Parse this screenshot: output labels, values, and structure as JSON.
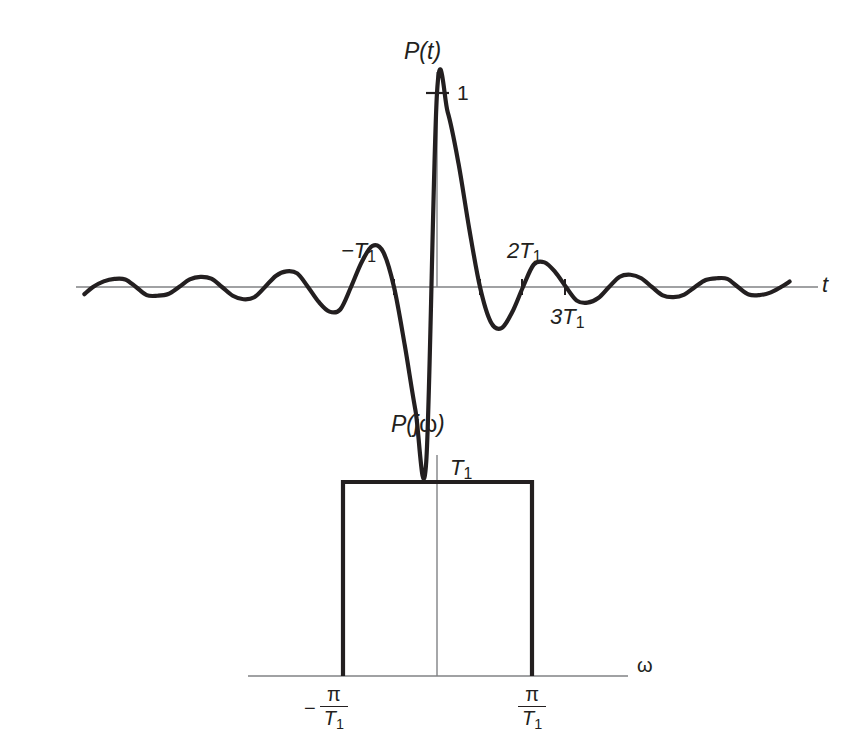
{
  "figure": {
    "background": "#ffffff",
    "ink": "#231f20",
    "axis_color": "#808285"
  },
  "chart_data": [
    {
      "type": "line",
      "title": "P(t)",
      "xlabel": "t",
      "ylabel": "",
      "description": "Sinc pulse p(t) = sin(pi t / T1) / (pi t / T1) in the time domain",
      "function": "sinc",
      "peak_value": 1,
      "peak_label": "1",
      "zero_crossings_T1": [
        -6,
        -5,
        -4,
        -3,
        -2,
        -1,
        1,
        2,
        3,
        4,
        5,
        6
      ],
      "x_range_T1": [
        -8.2,
        8.2
      ],
      "ylim": [
        -0.25,
        1.05
      ],
      "grid": false,
      "legend": false,
      "annotations": [
        {
          "text": "−T₁",
          "x_T1": -1,
          "position": "above-left"
        },
        {
          "text": "2T₁",
          "x_T1": 2,
          "position": "above"
        },
        {
          "text": "3T₁",
          "x_T1": 3,
          "position": "below"
        }
      ],
      "tick_positions_T1": [
        -1,
        1,
        2,
        3
      ],
      "x": [
        -8.2,
        -8.0,
        -7.75,
        -7.5,
        -7.25,
        -7.0,
        -6.75,
        -6.5,
        -6.25,
        -6.0,
        -5.75,
        -5.5,
        -5.25,
        -5.0,
        -4.75,
        -4.5,
        -4.25,
        -4.0,
        -3.75,
        -3.5,
        -3.25,
        -3.0,
        -2.75,
        -2.5,
        -2.25,
        -2.0,
        -1.75,
        -1.5,
        -1.25,
        -1.0,
        -0.75,
        -0.5,
        -0.25,
        0.0,
        0.25,
        0.5,
        0.75,
        1.0,
        1.25,
        1.5,
        1.75,
        2.0,
        2.25,
        2.5,
        2.75,
        3.0,
        3.25,
        3.5,
        3.75,
        4.0,
        4.25,
        4.5,
        4.75,
        5.0,
        5.25,
        5.5,
        5.75,
        6.0,
        6.25,
        6.5,
        6.75,
        7.0,
        7.25,
        7.5,
        7.75,
        8.0,
        8.2
      ],
      "y": [
        -0.037,
        -0.0,
        0.029,
        0.042,
        0.039,
        0.0,
        -0.042,
        -0.045,
        -0.036,
        0.0,
        0.039,
        0.052,
        0.043,
        0.0,
        -0.045,
        -0.063,
        -0.053,
        0.0,
        0.057,
        0.081,
        0.07,
        0.0,
        -0.077,
        -0.127,
        -0.116,
        0.0,
        0.129,
        0.212,
        0.18,
        0.0,
        -0.3,
        -0.637,
        -0.9,
        1.0,
        0.9,
        0.637,
        0.3,
        0.0,
        -0.18,
        -0.212,
        -0.129,
        0.0,
        0.116,
        0.127,
        0.077,
        0.0,
        -0.07,
        -0.081,
        -0.057,
        0.0,
        0.053,
        0.063,
        0.045,
        0.0,
        -0.043,
        -0.052,
        -0.039,
        0.0,
        0.036,
        0.045,
        0.042,
        0.0,
        -0.039,
        -0.042,
        -0.029,
        0.0,
        0.028
      ]
    },
    {
      "type": "line",
      "title": "P(jω)",
      "xlabel": "ω",
      "ylabel": "",
      "description": "Ideal lowpass rectangular spectrum of height T1 between -pi/T1 and pi/T1",
      "amplitude_label": "T₁",
      "amplitude_value": 1,
      "band_edges": [
        "−π/T₁",
        "π/T₁"
      ],
      "grid": false,
      "legend": false,
      "categories": [
        "below -pi/T1",
        "-pi/T1 to pi/T1",
        "above pi/T1"
      ],
      "values": [
        0,
        1,
        0
      ],
      "left_edge_label": {
        "sign": "−",
        "numerator": "π",
        "denominator": "T₁"
      },
      "right_edge_label": {
        "sign": "",
        "numerator": "π",
        "denominator": "T₁"
      }
    }
  ],
  "labels": {
    "top_title": "P(t)",
    "top_peak": "1",
    "top_axis": "t",
    "neg_T1": "−T",
    "neg_T1_sub": "1",
    "two_T1": "2T",
    "two_T1_sub": "1",
    "three_T1": "3T",
    "three_T1_sub": "1",
    "bottom_title_p": "P(j",
    "bottom_title_w": "ω",
    "bottom_title_close": ")",
    "bottom_amp": "T",
    "bottom_amp_sub": "1",
    "bottom_axis": "ω",
    "minus_sign": "−",
    "pi": "π",
    "T_letter": "T",
    "T_sub": "1"
  }
}
